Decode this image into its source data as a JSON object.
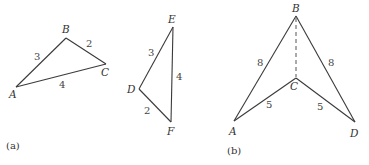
{
  "figure_a": {
    "caption": "(a)",
    "triangle_abc": {
      "vertices": {
        "A": "A",
        "B": "B",
        "C": "C"
      },
      "sides": {
        "AB": "3",
        "BC": "2",
        "AC": "4"
      }
    },
    "triangle_def": {
      "vertices": {
        "D": "D",
        "E": "E",
        "F": "F"
      },
      "sides": {
        "DE": "3",
        "EF": "4",
        "DF": "2"
      }
    }
  },
  "figure_b": {
    "caption": "(b)",
    "vertices": {
      "A": "A",
      "B": "B",
      "C": "C",
      "D": "D"
    },
    "sides": {
      "AB": "8",
      "BD": "8",
      "AC": "5",
      "CD": "5"
    },
    "dashed_segment": "BC"
  }
}
